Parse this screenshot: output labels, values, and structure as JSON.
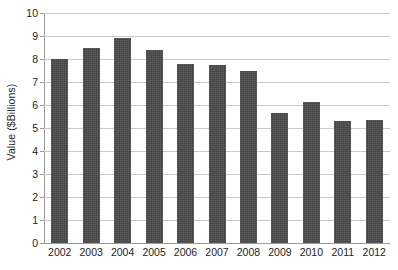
{
  "chart_data": {
    "type": "bar",
    "title": "",
    "subtitle": "",
    "xlabel": "",
    "ylabel": "Value ($Billions)",
    "categories": [
      "2002",
      "2003",
      "2004",
      "2005",
      "2006",
      "2007",
      "2008",
      "2009",
      "2010",
      "2011",
      "2012"
    ],
    "values": [
      8.0,
      8.5,
      8.9,
      8.4,
      7.8,
      7.75,
      7.5,
      5.65,
      6.15,
      5.3,
      5.35
    ],
    "series": [
      {
        "name": "Value",
        "values": [
          8.0,
          8.5,
          8.9,
          8.4,
          7.8,
          7.75,
          7.5,
          5.65,
          6.15,
          5.3,
          5.35
        ]
      }
    ],
    "ylim": [
      0,
      10
    ],
    "ytick_values": [
      0,
      1,
      2,
      3,
      4,
      5,
      6,
      7,
      8,
      9,
      10
    ],
    "ytick_labels": [
      "0",
      "1",
      "2",
      "3",
      "4",
      "5",
      "6",
      "7",
      "8",
      "9",
      "10"
    ],
    "ytick_step": 1,
    "grid": "horizontal",
    "legend": "none",
    "bar_color": "#4a4a4a",
    "gridline_color": "#c9c9c9",
    "axis_color": "#9a9a9a",
    "background_color": "#ffffff",
    "annotations": []
  }
}
